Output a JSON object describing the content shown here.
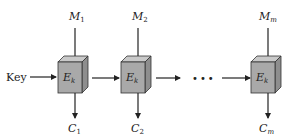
{
  "diagram": {
    "type": "ECB block cipher mode",
    "key_label": "Key",
    "ellipsis": "•••",
    "blocks": [
      {
        "input": "M",
        "input_sub": "1",
        "cipher": "E",
        "cipher_sub": "k",
        "output": "C",
        "output_sub": "1"
      },
      {
        "input": "M",
        "input_sub": "2",
        "cipher": "E",
        "cipher_sub": "k",
        "output": "C",
        "output_sub": "2"
      },
      {
        "input": "M",
        "input_sub": "m",
        "cipher": "E",
        "cipher_sub": "k",
        "output": "C",
        "output_sub": "m"
      }
    ],
    "colors": {
      "box_front": "#a9a9a9",
      "box_top": "#c9c9c9",
      "box_side": "#8e8e8e",
      "stroke": "#222222"
    }
  }
}
